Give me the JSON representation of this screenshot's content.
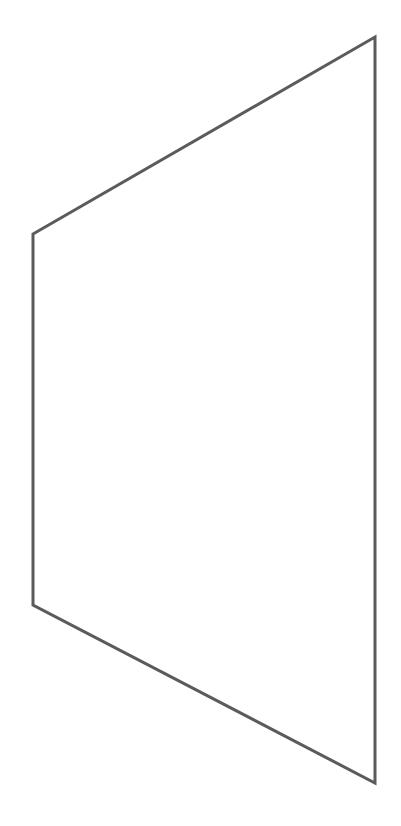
{
  "canvas": {
    "width": 401,
    "height": 826,
    "background_color": "#ffffff"
  },
  "figure": {
    "name": "quadrilateral-outline",
    "shape_type": "polygon",
    "sides": 4,
    "fill": "none",
    "stroke_color": "#5b5b5b",
    "stroke_width": 3,
    "vertices": [
      {
        "label": "top-left",
        "x": 33,
        "y": 234
      },
      {
        "label": "top-right",
        "x": 375,
        "y": 37
      },
      {
        "label": "bottom-right",
        "x": 375,
        "y": 783
      },
      {
        "label": "bottom-left",
        "x": 33,
        "y": 605
      }
    ],
    "points_attr": "33,234 375,37 375,783 33,605",
    "edges": [
      {
        "name": "top-edge",
        "from": "top-left",
        "to": "top-right",
        "orientation": "diagonal-up-right"
      },
      {
        "name": "right-edge",
        "from": "top-right",
        "to": "bottom-right",
        "orientation": "vertical"
      },
      {
        "name": "bottom-edge",
        "from": "bottom-right",
        "to": "bottom-left",
        "orientation": "diagonal-up-left"
      },
      {
        "name": "left-edge",
        "from": "bottom-left",
        "to": "top-left",
        "orientation": "vertical"
      }
    ]
  }
}
